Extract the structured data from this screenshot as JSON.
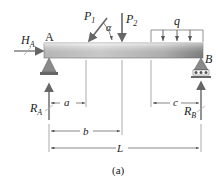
{
  "diagram": {
    "type": "simply-supported-beam",
    "caption": "(a)",
    "points": {
      "left": "A",
      "right": "B"
    },
    "loads": {
      "horizontal_reaction": {
        "symbol": "H",
        "subscript": "A"
      },
      "inclined_point_load": {
        "symbol": "P",
        "subscript": "1",
        "angle": "α"
      },
      "vertical_point_load": {
        "symbol": "P",
        "subscript": "2"
      },
      "distributed_load": {
        "symbol": "q"
      }
    },
    "reactions": {
      "left": {
        "symbol": "R",
        "subscript": "A"
      },
      "right": {
        "symbol": "R",
        "subscript": "B"
      }
    },
    "dimensions": {
      "a": "a",
      "b": "b",
      "c": "c",
      "L": "L"
    },
    "supports": {
      "left": "pin",
      "right": "roller"
    },
    "colors": {
      "beam_light": "#e8e8e8",
      "beam_dark": "#9a9a9a",
      "line": "#555555",
      "arrow": "#777777"
    }
  }
}
